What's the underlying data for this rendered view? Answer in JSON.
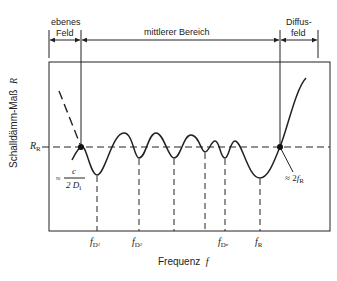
{
  "regions": {
    "ebenes_feld": {
      "line1": "ebenes",
      "line2": "Feld"
    },
    "mittlerer_bereich": "mittlerer Bereich",
    "diffusfeld": {
      "line1": "Diffus-",
      "line2": "feld"
    }
  },
  "axes": {
    "y_label": "Schalldämm-Maß",
    "y_symbol": "R",
    "x_label": "Frequenz",
    "x_symbol": "f",
    "ref_level": {
      "symbol": "R",
      "sub": "R"
    }
  },
  "annotations": {
    "left_point": {
      "approx": "≈",
      "numerator": "c",
      "denominator": "2 D",
      "den_sub": "i"
    },
    "right_point": {
      "approx": "≈ 2",
      "symbol": "f",
      "sub": "R"
    }
  },
  "x_ticks": [
    {
      "symbol": "f",
      "sub": "D",
      "sub2": "1"
    },
    {
      "symbol": "f",
      "sub": "D",
      "sub2": "2"
    },
    {
      "symbol": "f",
      "sub": "D",
      "sub2": "n"
    },
    {
      "symbol": "f",
      "sub": "R",
      "sub2": ""
    }
  ],
  "colors": {
    "line": "#222222",
    "background": "#ffffff"
  }
}
